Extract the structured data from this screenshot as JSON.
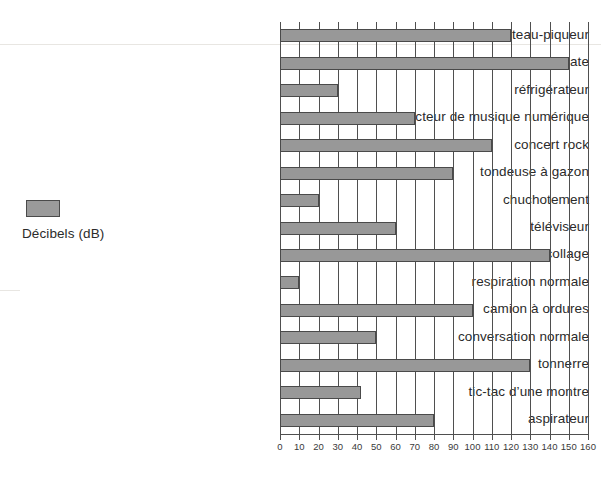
{
  "chart_data": {
    "type": "bar",
    "orientation": "horizontal",
    "title": "",
    "xlabel": "",
    "ylabel": "",
    "xlim": [
      0,
      160
    ],
    "xticks": [
      0,
      10,
      20,
      30,
      40,
      50,
      60,
      70,
      80,
      90,
      100,
      110,
      120,
      130,
      140,
      150,
      160
    ],
    "grid": true,
    "legend": {
      "position": "left",
      "entries": [
        {
          "label": "Décibels (dB)",
          "color": "#989898"
        }
      ]
    },
    "categories": [
      "marteau-piqueur",
      "ballon qui éclate",
      "réfrigérateur",
      "lecteur de musique numérique",
      "concert rock",
      "tondeuse à gazon",
      "chuchotement",
      "téléviseur",
      "avion au décollage",
      "respiration normale",
      "camion à ordures",
      "conversation normale",
      "tonnerre",
      "tic-tac d’une montre",
      "aspirateur"
    ],
    "values": [
      120,
      150,
      30,
      70,
      110,
      90,
      20,
      60,
      140,
      10,
      100,
      50,
      130,
      42,
      80
    ],
    "series": [
      {
        "name": "Décibels (dB)",
        "values": [
          120,
          150,
          30,
          70,
          110,
          90,
          20,
          60,
          140,
          10,
          100,
          50,
          130,
          42,
          80
        ]
      }
    ]
  },
  "colors": {
    "bar_fill": "#989898",
    "bar_border": "#4a4a4a",
    "grid": "#4f4f4f",
    "text": "#2b2b2b",
    "background": "#ffffff"
  }
}
